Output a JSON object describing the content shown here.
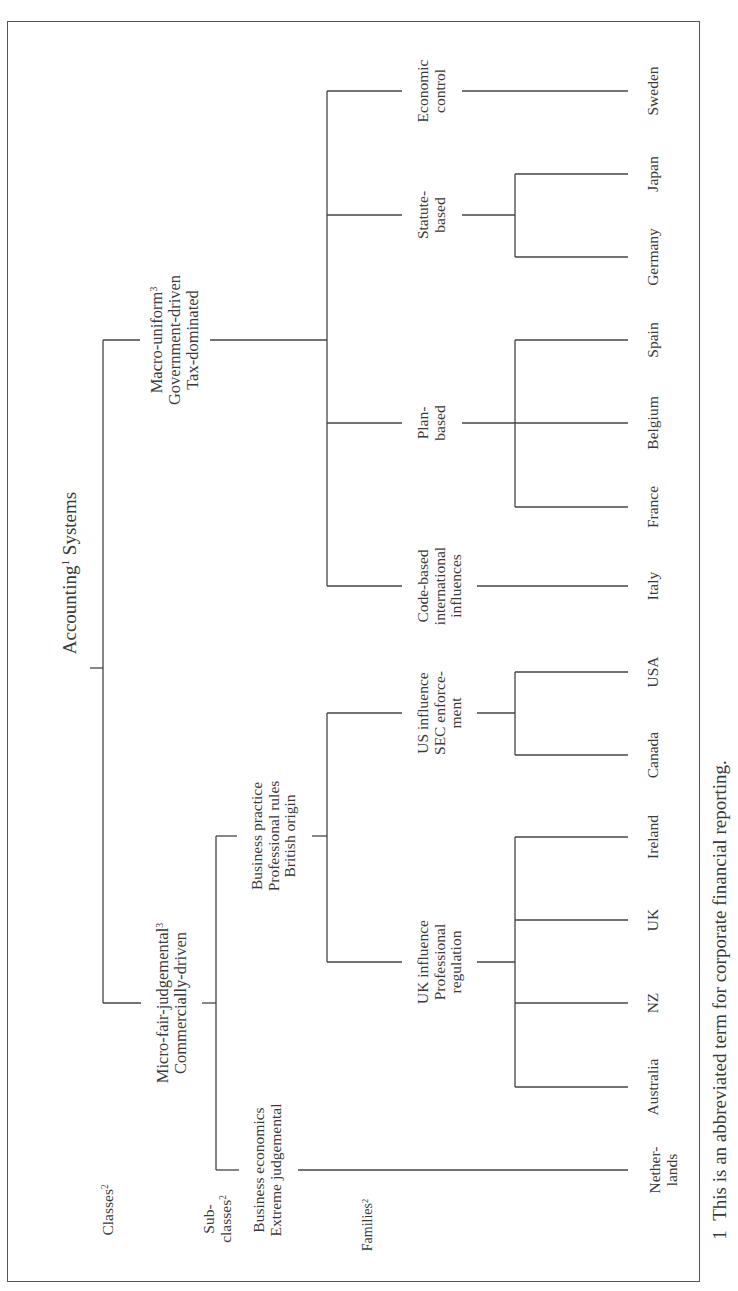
{
  "diagram": {
    "orientation": "rotated-90-ccw",
    "root": {
      "label": "Accounting",
      "sup": "1",
      "label_tail": " Systems"
    },
    "level_labels": {
      "classes": {
        "label": "Classes",
        "sup": "2"
      },
      "subclasses": {
        "line1": "Sub-",
        "line2": "classes",
        "sup": "2"
      },
      "families": {
        "label": "Families",
        "sup": "2"
      }
    },
    "classes": [
      {
        "id": "macro",
        "lines": [
          "Macro-uniform",
          "Government-driven",
          "Tax-dominated"
        ],
        "sup": "3",
        "families": [
          {
            "id": "code-based",
            "lines": [
              "Code-based",
              "international",
              "influences"
            ],
            "countries": [
              "Italy"
            ]
          },
          {
            "id": "plan-based",
            "lines": [
              "Plan-",
              "based"
            ],
            "countries": [
              "France",
              "Belgium",
              "Spain"
            ]
          },
          {
            "id": "statute-based",
            "lines": [
              "Statute-",
              "based"
            ],
            "countries": [
              "Germany",
              "Japan"
            ]
          },
          {
            "id": "economic-control",
            "lines": [
              "Economic",
              "control"
            ],
            "countries": [
              "Sweden"
            ]
          }
        ]
      },
      {
        "id": "micro",
        "lines": [
          "Micro-fair-judgemental",
          "Commercially-driven"
        ],
        "sup": "3",
        "subclasses": [
          {
            "id": "business-economics",
            "lines": [
              "Business economics",
              "Extreme judgemental"
            ],
            "countries": [
              [
                "Nether-",
                "lands"
              ]
            ]
          },
          {
            "id": "business-practice",
            "lines": [
              "Business practice",
              "Professional rules",
              "British origin"
            ],
            "families": [
              {
                "id": "uk-influence",
                "lines": [
                  "UK influence",
                  "Professional",
                  "regulation"
                ],
                "countries": [
                  "Australia",
                  "NZ",
                  "UK",
                  "Ireland"
                ]
              },
              {
                "id": "us-influence",
                "lines": [
                  "US influence",
                  "SEC enforce-",
                  "ment"
                ],
                "countries": [
                  "Canada",
                  "USA"
                ]
              }
            ]
          }
        ]
      }
    ],
    "footnote": {
      "number": "1",
      "text": "This is an abbreviated term for corporate financial reporting."
    }
  }
}
